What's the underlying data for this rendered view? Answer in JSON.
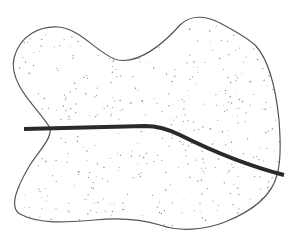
{
  "diagram": {
    "type": "region-with-crossing-line",
    "width": 298,
    "height": 240,
    "background": "#ffffff",
    "region": {
      "fill": "#ffffff",
      "stroke": "#555555",
      "stroke_width": 1.2,
      "stipple_color": "#8a8a8a",
      "stipple_count": 520,
      "path": "M 50 128 C 40 110, 8 85, 14 58 C 20 35, 40 26, 58 27 C 80 28, 100 56, 118 60 C 140 64, 165 42, 180 25 C 190 15, 205 15, 220 23 C 235 31, 248 38, 256 46 C 270 62, 276 90, 279 120 C 281 145, 280 165, 277 175 C 272 195, 255 210, 225 222 C 205 230, 180 232, 160 225 C 140 219, 115 218, 95 220 C 70 222, 40 225, 20 214 C 8 207, 18 185, 30 165 C 40 150, 52 138, 50 128 Z"
    },
    "line": {
      "stroke": "#2a2a2a",
      "stroke_width": 4,
      "path": "M 24 129 L 145 126 C 160 126, 170 130, 180 135 C 210 150, 245 165, 284 175"
    },
    "labels": []
  }
}
